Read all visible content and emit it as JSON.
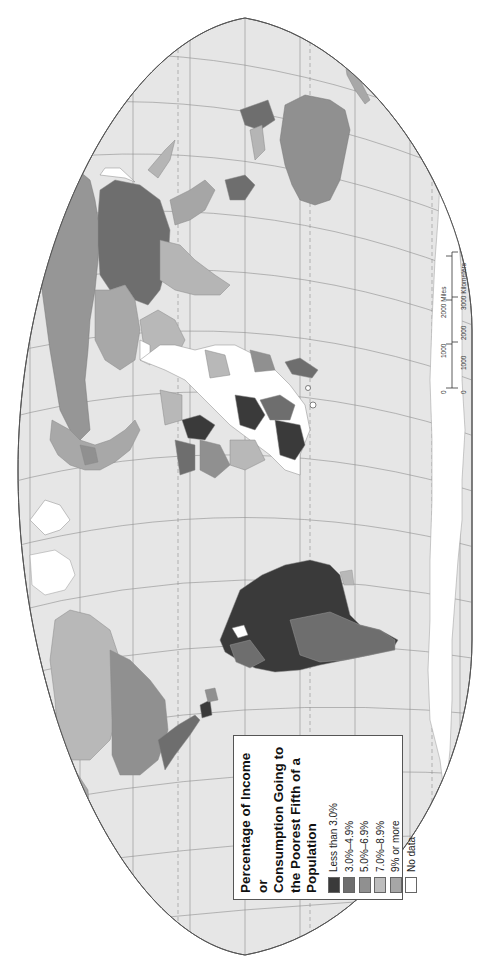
{
  "map": {
    "type": "choropleth world map",
    "orientation": "rotated 90 degrees counterclockwise",
    "projection": "Robinson-like with graticule",
    "background_color": "#ffffff",
    "ocean_color": "#e6e6e6",
    "graticule_color": "#8a8a8a"
  },
  "legend": {
    "title": "Percentage of Income or Consumption Going to the Poorest Fifth of a Population",
    "title_lines": [
      "Percentage of Income or",
      "Consumption Going to",
      "the Poorest Fifth of a",
      "Population"
    ],
    "items": [
      {
        "label": "Less than 3.0%",
        "color": "#3a3a3a"
      },
      {
        "label": "3.0%–4.9%",
        "color": "#6e6e6e"
      },
      {
        "label": "5.0%–6.9%",
        "color": "#909090"
      },
      {
        "label": "7.0%–8.9%",
        "color": "#bdbdbd"
      },
      {
        "label": "9% or more",
        "color": "#a6a6a6"
      },
      {
        "label": "No data",
        "color": "#ffffff"
      }
    ]
  },
  "scale_bar": {
    "miles": {
      "ticks": [
        "0",
        "1000",
        "2000"
      ],
      "unit": "Miles"
    },
    "kilometers": {
      "ticks": [
        "0",
        "1000",
        "2000",
        "3000"
      ],
      "unit": "Kilometers"
    },
    "miles_label": "2000 Miles",
    "km_label": "3000 Kilometers"
  }
}
